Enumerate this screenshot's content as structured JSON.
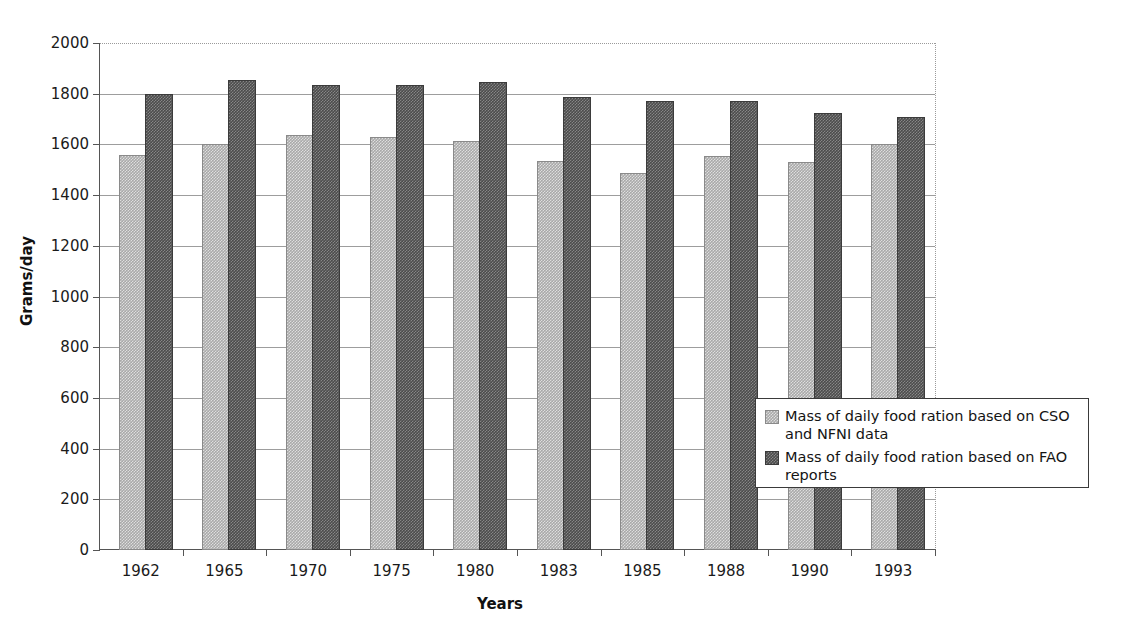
{
  "chart_data": {
    "type": "bar",
    "title": "",
    "xlabel": "Years",
    "ylabel": "Grams/day",
    "categories": [
      "1962",
      "1965",
      "1970",
      "1975",
      "1980",
      "1983",
      "1985",
      "1988",
      "1990",
      "1993"
    ],
    "series": [
      {
        "name": "Mass of daily food ration based on CSO and NFNI data",
        "values": [
          1550,
          1595,
          1630,
          1620,
          1605,
          1525,
          1478,
          1545,
          1522,
          1595
        ]
      },
      {
        "name": "Mass of daily food ration based on FAO reports",
        "values": [
          1790,
          1848,
          1825,
          1828,
          1838,
          1778,
          1762,
          1762,
          1715,
          1700
        ]
      }
    ],
    "ylim": [
      0,
      2000
    ],
    "ytick_values": [
      0,
      200,
      400,
      600,
      800,
      1000,
      1200,
      1400,
      1600,
      1800,
      2000
    ],
    "ytick_labels": [
      "0",
      "200",
      "400",
      "600",
      "800",
      "1000",
      "1200",
      "1400",
      "1600",
      "1800",
      "2000"
    ],
    "grid": "horizontal",
    "legend_position": "inside-bottom-right",
    "colors": {
      "series_0": "#a9a9a9",
      "series_1": "#4c4c4c",
      "gridline": "#9d9d9d",
      "axis": "#555555",
      "text": "#1a1a1a",
      "legend_border": "#3a3a3a",
      "plot_border": "#9a9a9a"
    }
  },
  "legend": {
    "items": [
      {
        "label": "Mass of daily food ration based on CSO and NFNI data"
      },
      {
        "label": "Mass of daily food ration based on FAO reports"
      }
    ]
  }
}
